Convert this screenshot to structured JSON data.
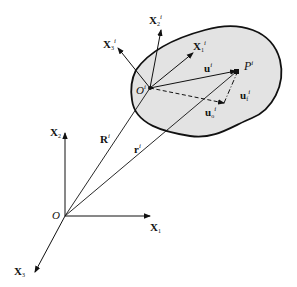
{
  "diagram": {
    "title": "",
    "global_frame": {
      "origin_label": "O",
      "axes": [
        {
          "name": "X",
          "sub": "1"
        },
        {
          "name": "X",
          "sub": "2"
        },
        {
          "name": "X",
          "sub": "3"
        }
      ]
    },
    "body_frame": {
      "origin_label": "O",
      "origin_sup": "i",
      "axes": [
        {
          "name": "X",
          "sub": "1",
          "sup": "i"
        },
        {
          "name": "X",
          "sub": "2",
          "sup": "i"
        },
        {
          "name": "X",
          "sub": "3",
          "sup": "i"
        }
      ]
    },
    "vectors": {
      "R": {
        "name": "R",
        "sup": "i"
      },
      "r": {
        "name": "r",
        "sup": "i"
      },
      "u": {
        "name": "u",
        "sup": "i"
      },
      "uo": {
        "name": "u",
        "sub": "o",
        "sup": "i"
      },
      "uf": {
        "name": "u",
        "sub": "f",
        "sup": "i"
      }
    },
    "point": {
      "name": "P",
      "sup": "i"
    },
    "colors": {
      "body_fill": "#e3e3e3",
      "stroke": "#111111"
    }
  }
}
